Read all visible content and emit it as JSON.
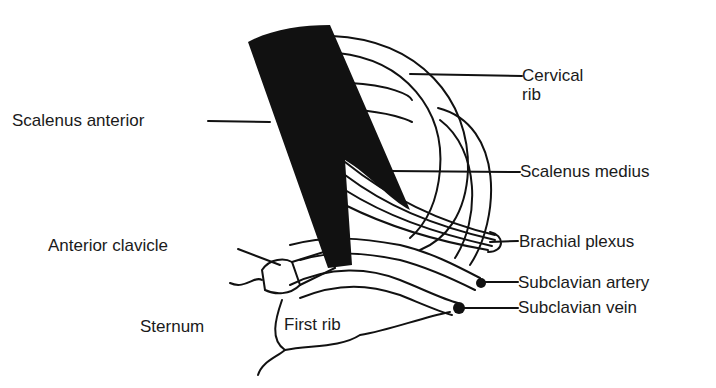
{
  "figure": {
    "type": "anatomical line drawing"
  },
  "labels": {
    "cervical_rib_line1": "Cervical",
    "cervical_rib_line2": "rib",
    "scalenus_anterior": "Scalenus anterior",
    "scalenus_medius": "Scalenus medius",
    "brachial_plexus": "Brachial plexus",
    "anterior_clavicle": "Anterior clavicle",
    "subclavian_artery": "Subclavian artery",
    "subclavian_vein": "Subclavian vein",
    "sternum": "Sternum",
    "first_rib": "First rib"
  },
  "colors": {
    "ink": "#111111",
    "background": "#ffffff"
  }
}
